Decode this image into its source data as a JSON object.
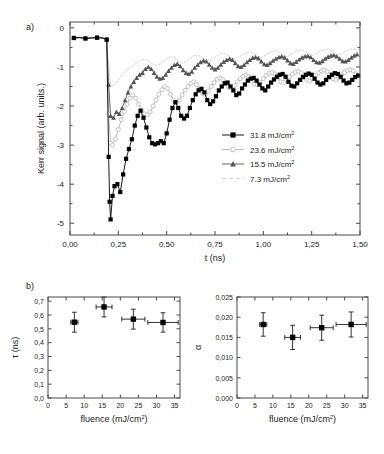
{
  "figure": {
    "panel_a_label": "a)",
    "panel_b_label": "b)"
  },
  "chart_data": [
    {
      "type": "line",
      "panel": "a",
      "title": "",
      "xlabel": "t (ns)",
      "ylabel": "Kerr signal (arb. units.)",
      "xlim": [
        0.0,
        1.5
      ],
      "ylim": [
        -5.3,
        0.15
      ],
      "xticks": [
        0.0,
        0.25,
        0.5,
        0.75,
        1.0,
        1.25,
        1.5
      ],
      "xticklabels": [
        "0,00",
        "0,25",
        "0,50",
        "0,75",
        "1,00",
        "1,25",
        "1,50"
      ],
      "yticks": [
        0,
        -1,
        -2,
        -3,
        -4,
        -5
      ],
      "yticklabels": [
        "0",
        "-1",
        "-2",
        "-3",
        "-4",
        "-5"
      ],
      "grid": false,
      "legend_position": "center-right",
      "series": [
        {
          "name": "31.8 mJ/cm2",
          "label_value": "31.8",
          "label_unit": "mJ/cm",
          "label_exp": "2",
          "marker": "filled-square",
          "color": "#000000",
          "x": [
            0.02,
            0.05,
            0.08,
            0.11,
            0.14,
            0.17,
            0.19,
            0.2,
            0.205,
            0.21,
            0.22,
            0.23,
            0.245,
            0.26,
            0.275,
            0.29,
            0.305,
            0.32,
            0.335,
            0.35,
            0.365,
            0.38,
            0.395,
            0.41,
            0.425,
            0.44,
            0.455,
            0.47,
            0.485,
            0.5,
            0.515,
            0.53,
            0.545,
            0.56,
            0.575,
            0.59,
            0.605,
            0.62,
            0.635,
            0.65,
            0.665,
            0.68,
            0.695,
            0.71,
            0.725,
            0.74,
            0.755,
            0.77,
            0.785,
            0.8,
            0.815,
            0.83,
            0.845,
            0.86,
            0.875,
            0.89,
            0.905,
            0.92,
            0.935,
            0.95,
            0.965,
            0.98,
            0.995,
            1.01,
            1.025,
            1.04,
            1.055,
            1.07,
            1.085,
            1.1,
            1.115,
            1.13,
            1.145,
            1.16,
            1.175,
            1.19,
            1.205,
            1.22,
            1.235,
            1.25,
            1.265,
            1.28,
            1.295,
            1.31,
            1.325,
            1.34,
            1.355,
            1.37,
            1.385,
            1.4,
            1.415,
            1.43,
            1.445,
            1.46,
            1.475,
            1.49
          ],
          "y": [
            -0.26,
            -0.25,
            -0.27,
            -0.26,
            -0.25,
            -0.26,
            -0.3,
            -3.3,
            -4.45,
            -4.9,
            -4.3,
            -4.05,
            -4.0,
            -4.2,
            -3.75,
            -3.35,
            -3.1,
            -2.85,
            -2.5,
            -2.25,
            -2.12,
            -2.3,
            -2.55,
            -2.8,
            -2.95,
            -2.98,
            -2.95,
            -2.9,
            -2.95,
            -2.7,
            -2.35,
            -2.05,
            -1.9,
            -2.05,
            -2.25,
            -2.32,
            -2.25,
            -2.05,
            -1.85,
            -1.7,
            -1.6,
            -1.56,
            -1.65,
            -1.85,
            -1.95,
            -1.88,
            -1.75,
            -1.6,
            -1.5,
            -1.42,
            -1.4,
            -1.5,
            -1.6,
            -1.72,
            -1.68,
            -1.55,
            -1.45,
            -1.35,
            -1.3,
            -1.28,
            -1.35,
            -1.45,
            -1.55,
            -1.6,
            -1.5,
            -1.4,
            -1.32,
            -1.25,
            -1.2,
            -1.18,
            -1.25,
            -1.38,
            -1.48,
            -1.5,
            -1.42,
            -1.33,
            -1.26,
            -1.2,
            -1.17,
            -1.2,
            -1.3,
            -1.4,
            -1.45,
            -1.42,
            -1.33,
            -1.26,
            -1.2,
            -1.16,
            -1.18,
            -1.25,
            -1.35,
            -1.42,
            -1.4,
            -1.33,
            -1.26,
            -1.22
          ]
        },
        {
          "name": "23.6 mJ/cm2",
          "label_value": "23.6",
          "label_unit": "mJ/cm",
          "label_exp": "2",
          "marker": "open-circle",
          "color": "#b4b4b4",
          "x": [
            0.02,
            0.05,
            0.08,
            0.11,
            0.14,
            0.17,
            0.19,
            0.2,
            0.21,
            0.22,
            0.235,
            0.25,
            0.265,
            0.28,
            0.295,
            0.31,
            0.325,
            0.34,
            0.355,
            0.37,
            0.385,
            0.4,
            0.415,
            0.43,
            0.445,
            0.46,
            0.475,
            0.49,
            0.505,
            0.52,
            0.535,
            0.55,
            0.565,
            0.58,
            0.595,
            0.61,
            0.625,
            0.64,
            0.655,
            0.67,
            0.685,
            0.7,
            0.715,
            0.73,
            0.745,
            0.76,
            0.775,
            0.79,
            0.805,
            0.82,
            0.835,
            0.85,
            0.865,
            0.88,
            0.895,
            0.91,
            0.925,
            0.94,
            0.955,
            0.97,
            0.985,
            1.0,
            1.015,
            1.03,
            1.045,
            1.06,
            1.075,
            1.09,
            1.105,
            1.12,
            1.135,
            1.15,
            1.165,
            1.18,
            1.195,
            1.21,
            1.225,
            1.24,
            1.255,
            1.27,
            1.285,
            1.3,
            1.315,
            1.33,
            1.345,
            1.36,
            1.375,
            1.39,
            1.405,
            1.42,
            1.435,
            1.45,
            1.465,
            1.48
          ],
          "y": [
            -0.25,
            -0.24,
            -0.26,
            -0.25,
            -0.24,
            -0.25,
            -0.3,
            -2.2,
            -2.95,
            -3.0,
            -2.85,
            -2.6,
            -2.35,
            -2.15,
            -1.95,
            -1.8,
            -1.72,
            -1.8,
            -1.95,
            -2.1,
            -2.2,
            -2.22,
            -2.15,
            -2.0,
            -1.85,
            -1.7,
            -1.58,
            -1.5,
            -1.55,
            -1.7,
            -1.85,
            -1.92,
            -1.85,
            -1.72,
            -1.6,
            -1.5,
            -1.42,
            -1.38,
            -1.45,
            -1.58,
            -1.68,
            -1.7,
            -1.62,
            -1.5,
            -1.4,
            -1.32,
            -1.28,
            -1.32,
            -1.42,
            -1.52,
            -1.55,
            -1.48,
            -1.38,
            -1.3,
            -1.24,
            -1.2,
            -1.24,
            -1.34,
            -1.44,
            -1.46,
            -1.4,
            -1.3,
            -1.22,
            -1.16,
            -1.14,
            -1.18,
            -1.28,
            -1.38,
            -1.4,
            -1.34,
            -1.25,
            -1.18,
            -1.13,
            -1.11,
            -1.15,
            -1.24,
            -1.33,
            -1.36,
            -1.3,
            -1.22,
            -1.15,
            -1.1,
            -1.08,
            -1.12,
            -1.2,
            -1.3,
            -1.33,
            -1.28,
            -1.2,
            -1.14,
            -1.09,
            -1.07,
            -1.1,
            -1.18,
            -1.25,
            -1.28
          ]
        },
        {
          "name": "15.5 mJ/cm2",
          "label_value": "15.5",
          "label_unit": "mJ/cm",
          "label_exp": "2",
          "marker": "filled-triangle",
          "color": "#555555",
          "x": [
            0.02,
            0.05,
            0.08,
            0.11,
            0.14,
            0.17,
            0.19,
            0.2,
            0.21,
            0.225,
            0.24,
            0.255,
            0.27,
            0.285,
            0.3,
            0.315,
            0.33,
            0.345,
            0.36,
            0.375,
            0.39,
            0.405,
            0.42,
            0.435,
            0.45,
            0.465,
            0.48,
            0.495,
            0.51,
            0.525,
            0.54,
            0.555,
            0.57,
            0.585,
            0.6,
            0.615,
            0.63,
            0.645,
            0.66,
            0.675,
            0.69,
            0.705,
            0.72,
            0.735,
            0.75,
            0.765,
            0.78,
            0.795,
            0.81,
            0.825,
            0.84,
            0.855,
            0.87,
            0.885,
            0.9,
            0.915,
            0.93,
            0.945,
            0.96,
            0.975,
            0.99,
            1.005,
            1.02,
            1.035,
            1.05,
            1.065,
            1.08,
            1.095,
            1.11,
            1.125,
            1.14,
            1.155,
            1.17,
            1.185,
            1.2,
            1.215,
            1.23,
            1.245,
            1.26,
            1.275,
            1.29,
            1.305,
            1.32,
            1.335,
            1.35,
            1.365,
            1.38,
            1.395,
            1.41,
            1.425,
            1.44,
            1.455,
            1.47,
            1.485
          ],
          "y": [
            -0.26,
            -0.25,
            -0.27,
            -0.26,
            -0.25,
            -0.26,
            -0.3,
            -1.45,
            -2.25,
            -2.3,
            -2.15,
            -2.2,
            -2.05,
            -1.85,
            -1.65,
            -1.5,
            -1.38,
            -1.28,
            -1.2,
            -1.15,
            -1.05,
            -1.0,
            -1.05,
            -1.15,
            -1.25,
            -1.3,
            -1.28,
            -1.2,
            -1.1,
            -1.02,
            -0.95,
            -0.92,
            -0.98,
            -1.08,
            -1.15,
            -1.18,
            -1.12,
            -1.02,
            -0.95,
            -0.88,
            -0.84,
            -0.86,
            -0.94,
            -1.02,
            -1.06,
            -1.02,
            -0.94,
            -0.87,
            -0.82,
            -0.79,
            -0.82,
            -0.9,
            -0.98,
            -1.0,
            -0.95,
            -0.88,
            -0.82,
            -0.77,
            -0.75,
            -0.78,
            -0.86,
            -0.93,
            -0.95,
            -0.9,
            -0.84,
            -0.79,
            -0.75,
            -0.73,
            -0.76,
            -0.83,
            -0.9,
            -0.92,
            -0.87,
            -0.81,
            -0.76,
            -0.73,
            -0.72,
            -0.75,
            -0.82,
            -0.88,
            -0.89,
            -0.85,
            -0.79,
            -0.74,
            -0.71,
            -0.7,
            -0.73,
            -0.79,
            -0.85,
            -0.86,
            -0.82,
            -0.76,
            -0.71,
            -0.68
          ]
        },
        {
          "name": "7.3 mJ/cm2",
          "label_value": "7.3",
          "label_unit": "mJ/cm",
          "label_exp": "2",
          "marker": "dashed-line",
          "color": "#c8c8c8",
          "x": [
            0.02,
            0.05,
            0.08,
            0.11,
            0.14,
            0.17,
            0.19,
            0.2,
            0.21,
            0.225,
            0.24,
            0.255,
            0.27,
            0.285,
            0.3,
            0.315,
            0.33,
            0.345,
            0.36,
            0.375,
            0.39,
            0.405,
            0.42,
            0.435,
            0.45,
            0.465,
            0.48,
            0.495,
            0.51,
            0.525,
            0.54,
            0.555,
            0.57,
            0.585,
            0.6,
            0.615,
            0.63,
            0.645,
            0.66,
            0.675,
            0.69,
            0.705,
            0.72,
            0.735,
            0.75,
            0.765,
            0.78,
            0.795,
            0.81,
            0.825,
            0.84,
            0.855,
            0.87,
            0.885,
            0.9,
            0.915,
            0.93,
            0.945,
            0.96,
            0.975,
            0.99,
            1.005,
            1.02,
            1.035,
            1.05,
            1.065,
            1.08,
            1.095,
            1.11,
            1.125,
            1.14,
            1.155,
            1.17,
            1.185,
            1.2,
            1.215,
            1.23,
            1.245,
            1.26,
            1.275,
            1.29,
            1.305,
            1.32,
            1.335,
            1.35,
            1.365,
            1.38,
            1.395,
            1.41,
            1.425,
            1.44,
            1.455,
            1.47,
            1.485
          ],
          "y": [
            -0.24,
            -0.23,
            -0.25,
            -0.24,
            -0.23,
            -0.24,
            -0.28,
            -0.95,
            -1.45,
            -1.5,
            -1.4,
            -1.3,
            -1.2,
            -1.12,
            -1.05,
            -1.0,
            -0.95,
            -0.9,
            -0.85,
            -0.82,
            -0.8,
            -0.84,
            -0.9,
            -0.95,
            -0.96,
            -0.92,
            -0.86,
            -0.8,
            -0.76,
            -0.74,
            -0.77,
            -0.83,
            -0.89,
            -0.9,
            -0.86,
            -0.8,
            -0.75,
            -0.71,
            -0.7,
            -0.73,
            -0.79,
            -0.84,
            -0.85,
            -0.81,
            -0.75,
            -0.7,
            -0.66,
            -0.65,
            -0.68,
            -0.74,
            -0.79,
            -0.8,
            -0.76,
            -0.71,
            -0.66,
            -0.63,
            -0.62,
            -0.65,
            -0.7,
            -0.75,
            -0.76,
            -0.72,
            -0.67,
            -0.63,
            -0.6,
            -0.59,
            -0.62,
            -0.67,
            -0.72,
            -0.73,
            -0.69,
            -0.64,
            -0.6,
            -0.57,
            -0.57,
            -0.6,
            -0.65,
            -0.69,
            -0.7,
            -0.66,
            -0.61,
            -0.58,
            -0.55,
            -0.55,
            -0.58,
            -0.63,
            -0.67,
            -0.68,
            -0.64,
            -0.6,
            -0.56,
            -0.54,
            -0.55,
            -0.58
          ]
        }
      ]
    },
    {
      "type": "scatter",
      "panel": "b-left",
      "title": "",
      "xlabel_main": "fluence (mJ/cm",
      "xlabel_exp": "2",
      "xlabel_close": ")",
      "ylabel": "τ (ns)",
      "xlim": [
        0,
        36.5
      ],
      "ylim": [
        0.0,
        0.73
      ],
      "xticks": [
        0,
        5,
        10,
        15,
        20,
        25,
        30,
        35
      ],
      "xticklabels": [
        "0",
        "5",
        "10",
        "15",
        "20",
        "25",
        "30",
        "35"
      ],
      "yticks": [
        0.0,
        0.1,
        0.2,
        0.3,
        0.4,
        0.5,
        0.6,
        0.7
      ],
      "yticklabels": [
        "0,0",
        "0,1",
        "0,2",
        "0,3",
        "0,4",
        "0,5",
        "0,6",
        "0,7"
      ],
      "grid": false,
      "marker": "filled-square",
      "color": "#000000",
      "points": [
        {
          "x": 7.3,
          "y": 0.548,
          "xerr": 1.0,
          "yerr": 0.072
        },
        {
          "x": 15.5,
          "y": 0.658,
          "xerr": 2.2,
          "yerr": 0.072
        },
        {
          "x": 23.6,
          "y": 0.57,
          "xerr": 3.2,
          "yerr": 0.072
        },
        {
          "x": 31.8,
          "y": 0.546,
          "xerr": 4.2,
          "yerr": 0.07
        }
      ]
    },
    {
      "type": "scatter",
      "panel": "b-right",
      "title": "",
      "xlabel_main": "fluence (mJ/cm",
      "xlabel_exp": "2",
      "xlabel_close": ")",
      "ylabel": "α",
      "xlim": [
        0,
        36.5
      ],
      "ylim": [
        0.0,
        0.025
      ],
      "xticks": [
        0,
        5,
        10,
        15,
        20,
        25,
        30,
        35
      ],
      "xticklabels": [
        "0",
        "5",
        "10",
        "15",
        "20",
        "25",
        "30",
        "35"
      ],
      "yticks": [
        0.0,
        0.005,
        0.01,
        0.015,
        0.02,
        0.025
      ],
      "yticklabels": [
        "0,000",
        "0,005",
        "0,010",
        "0,015",
        "0,020",
        "0,025"
      ],
      "grid": false,
      "marker": "filled-square",
      "color": "#000000",
      "points": [
        {
          "x": 7.3,
          "y": 0.0182,
          "xerr": 1.0,
          "yerr": 0.0029
        },
        {
          "x": 15.5,
          "y": 0.015,
          "xerr": 2.2,
          "yerr": 0.003
        },
        {
          "x": 23.6,
          "y": 0.0174,
          "xerr": 3.2,
          "yerr": 0.0031
        },
        {
          "x": 31.8,
          "y": 0.0182,
          "xerr": 4.2,
          "yerr": 0.0031
        }
      ]
    }
  ]
}
